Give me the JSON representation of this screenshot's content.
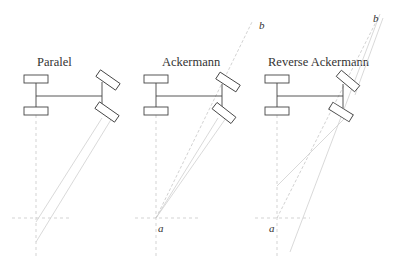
{
  "figure": {
    "panels": [
      {
        "title": "Paralel",
        "labels": {}
      },
      {
        "title": "Ackermann",
        "labels": {
          "a": "a",
          "b": "b"
        }
      },
      {
        "title": "Reverse Ackermann",
        "labels": {
          "a": "a",
          "b": "b"
        }
      }
    ],
    "colors": {
      "outline": "#444444",
      "construction_lines": "#cfcfcf",
      "text": "#333333"
    }
  }
}
